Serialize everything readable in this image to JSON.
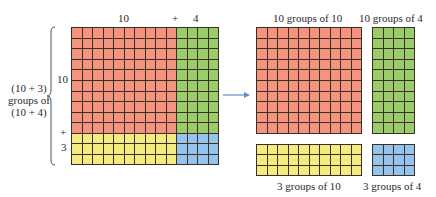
{
  "colors": {
    "red": "#F4937E",
    "green": "#9ACD6A",
    "yellow": "#F5EC7F",
    "blue": "#94C4EE",
    "line": "#3b2e24",
    "arrow": "#5B8FC7"
  },
  "left": {
    "top_label_10": "10",
    "top_plus": "+",
    "top_label_4": "4",
    "side_label_10": "10",
    "side_plus": "+",
    "side_label_3": "3",
    "brace_label_line1": "(10 + 3)",
    "brace_label_line2": "groups of",
    "brace_label_line3": "(10 + 4)"
  },
  "right": {
    "label_red": "10 groups of 10",
    "label_green": "10 groups  of 4",
    "label_yellow": "3 groups of 10",
    "label_blue": "3 groups of 4"
  },
  "blocks": [
    {
      "id": "red",
      "rows": 10,
      "cols": 10
    },
    {
      "id": "green",
      "rows": 10,
      "cols": 4
    },
    {
      "id": "yellow",
      "rows": 3,
      "cols": 10
    },
    {
      "id": "blue",
      "rows": 3,
      "cols": 4
    }
  ]
}
